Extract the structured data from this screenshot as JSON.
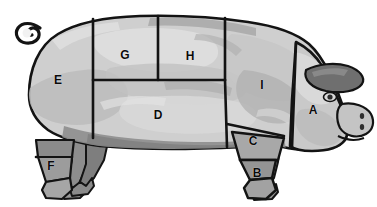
{
  "diagram": {
    "orientation": "facing-right",
    "background_color": "#ffffff",
    "outline_color": "#111111",
    "divider_color": "#111111",
    "body_fill_light": "#d2d2d2",
    "body_fill_mid": "#bdbdbd",
    "body_fill_dark": "#9a9a9a",
    "leg_fill_dark": "#7e7e7e",
    "label_color": "#0a0a0a"
  },
  "cuts": [
    {
      "letter": "A",
      "x": 313,
      "y": 110,
      "region": "head-jowl"
    },
    {
      "letter": "B",
      "x": 257,
      "y": 173,
      "region": "front-trotter"
    },
    {
      "letter": "C",
      "x": 253,
      "y": 141,
      "region": "front-hock"
    },
    {
      "letter": "D",
      "x": 158,
      "y": 115,
      "region": "belly-side"
    },
    {
      "letter": "E",
      "x": 58,
      "y": 80,
      "region": "ham-rear"
    },
    {
      "letter": "F",
      "x": 51,
      "y": 166,
      "region": "rear-hock"
    },
    {
      "letter": "G",
      "x": 125,
      "y": 55,
      "region": "loin-rear"
    },
    {
      "letter": "H",
      "x": 190,
      "y": 56,
      "region": "loin-front"
    },
    {
      "letter": "I",
      "x": 262,
      "y": 85,
      "region": "shoulder-butt"
    }
  ]
}
